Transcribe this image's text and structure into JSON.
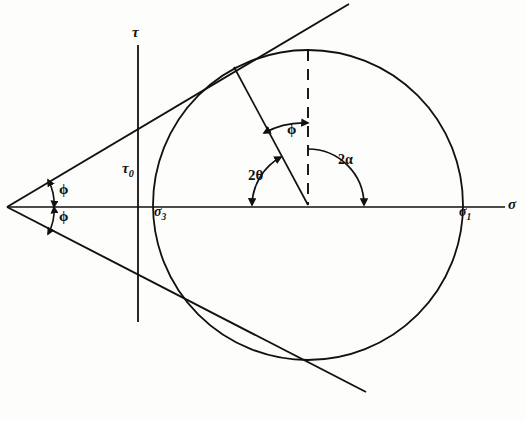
{
  "figure": {
    "background_color": "#fdfdfb",
    "ink_color": "#111111"
  },
  "axes": {
    "horizontal": {
      "name": "normal-stress-axis",
      "label": "σ",
      "label_x": 513,
      "label_y": 205,
      "y": 207,
      "x_start": 7,
      "x_end": 505
    },
    "vertical": {
      "name": "shear-stress-axis",
      "label": "τ",
      "label_x": 138,
      "label_y": 33,
      "x": 138,
      "y_start": 45,
      "y_end": 322
    },
    "cohesion_label": "τ",
    "cohesion_sub": "0"
  },
  "labels": [
    {
      "id": "tau-axis",
      "text": "τ",
      "sub": "",
      "x": 138,
      "y": 33
    },
    {
      "id": "tau-zero",
      "text": "τ",
      "sub": "0",
      "x": 130,
      "y": 170
    },
    {
      "id": "sigma-axis",
      "text": "σ",
      "sub": "",
      "x": 513,
      "y": 205
    },
    {
      "id": "sigma-3",
      "text": "σ",
      "sub": "3",
      "x": 162,
      "y": 212
    },
    {
      "id": "sigma-1",
      "text": "σ",
      "sub": "1",
      "x": 466,
      "y": 212
    },
    {
      "id": "phi-upper",
      "text": "ϕ",
      "sub": "",
      "x": 64,
      "y": 190
    },
    {
      "id": "phi-lower",
      "text": "ϕ",
      "sub": "",
      "x": 64,
      "y": 218
    },
    {
      "id": "phi-inner",
      "text": "ϕ",
      "sub": "",
      "x": 293,
      "y": 131
    },
    {
      "id": "two-theta",
      "text": "2θ",
      "sub": "",
      "x": 259,
      "y": 178
    },
    {
      "id": "two-alpha",
      "text": "2α",
      "sub": "",
      "x": 348,
      "y": 163
    }
  ],
  "geometry": {
    "apex": {
      "x": 7,
      "y": 207
    },
    "circle": {
      "center_x": 308,
      "center_y": 205,
      "radius": 155,
      "sigma3_x": 153,
      "sigma1_x": 463,
      "top_y": 50,
      "bottom_y": 360
    },
    "envelope_upper": {
      "x1": 7,
      "y1": 207,
      "x2": 349,
      "y2": 4
    },
    "envelope_lower": {
      "x1": 7,
      "y1": 207,
      "x2": 366,
      "y2": 392
    },
    "tangent_point_upper": {
      "x": 234,
      "y": 67
    },
    "tangent_point_lower": {
      "x": 234,
      "y": 343
    },
    "dashed_line": {
      "x": 308,
      "y1": 50,
      "y2": 205
    },
    "radius_line": {
      "x1": 308,
      "y1": 205,
      "x2": 234,
      "y2": 67
    },
    "friction_angle_deg": 30.7,
    "two_alpha_deg": 118,
    "two_theta_deg": 180
  },
  "angle_arcs": [
    {
      "id": "phi-arc-upper",
      "name": "phi-arc-upper",
      "radius": 48,
      "from_deg": 0,
      "to_deg": 30.7
    },
    {
      "id": "phi-arc-lower",
      "name": "phi-arc-lower",
      "radius": 48,
      "from_deg": 0,
      "to_deg": -30.7
    },
    {
      "id": "two-alpha-arc",
      "name": "two-alpha-arc",
      "radius": 56,
      "from_deg": 90,
      "to_deg": 0
    },
    {
      "id": "two-theta-arc",
      "name": "two-theta-arc",
      "radius": 56,
      "from_deg": 180,
      "to_deg": 118
    },
    {
      "id": "phi-inner-arc",
      "name": "phi-inner-arc",
      "radius": 82,
      "from_deg": 118,
      "to_deg": 90
    }
  ]
}
